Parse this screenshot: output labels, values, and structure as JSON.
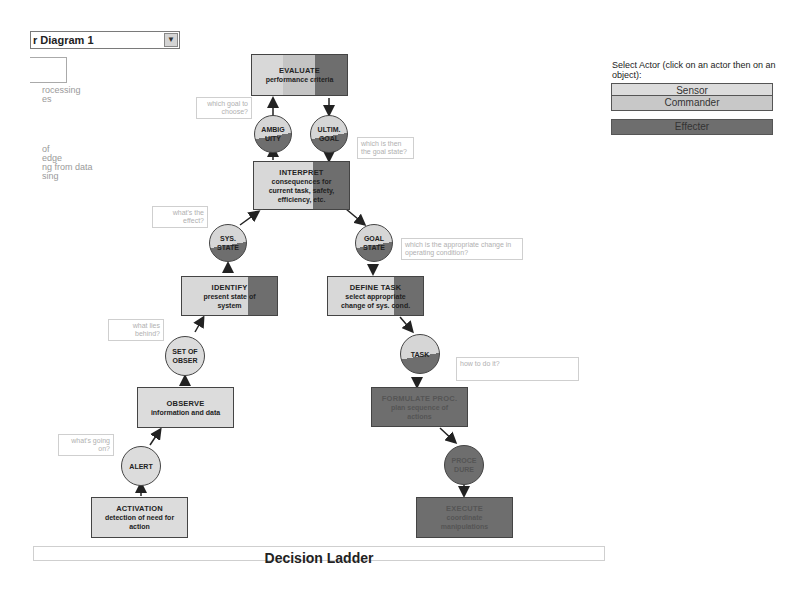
{
  "toolbar": {
    "diagram_select_value": "r Diagram 1",
    "diagram_select_arrow": "▼"
  },
  "left_panel": {
    "text_lines_a": [
      "rocessing",
      "es"
    ],
    "text_lines_b": [
      "of",
      "edge",
      "ng from data",
      "sing"
    ]
  },
  "actor_panel": {
    "title": "Select Actor (click on an actor then on an object):",
    "actors": [
      {
        "label": "Sensor",
        "color": "#d8d8d8"
      },
      {
        "label": "Commander",
        "color": "#c4c4c4"
      },
      {
        "label": "Effecter",
        "color": "#6e6e6e"
      }
    ]
  },
  "diagram": {
    "title": "Decision Ladder",
    "nodes": {
      "evaluate": {
        "title": "EVALUATE",
        "sub": "performance criteria"
      },
      "ambiguity": {
        "line1": "AMBIG",
        "line2": "UITY"
      },
      "ultim_goal": {
        "line1": "ULTIM.",
        "line2": "GOAL"
      },
      "interpret": {
        "title": "INTERPRET",
        "sub1": "consequences for",
        "sub2": "current task, safety,",
        "sub3": "efficiency, etc."
      },
      "sys_state": {
        "line1": "SYS.",
        "line2": "STATE"
      },
      "goal_state": {
        "line1": "GOAL",
        "line2": "STATE"
      },
      "identify": {
        "title": "IDENTIFY",
        "sub1": "present state of",
        "sub2": "system"
      },
      "define_task": {
        "title": "DEFINE TASK",
        "sub1": "select appropriate",
        "sub2": "change of sys. cond."
      },
      "set_of_obser": {
        "line1": "SET OF",
        "line2": "OBSER"
      },
      "task": {
        "line1": "TASK"
      },
      "observe": {
        "title": "OBSERVE",
        "sub1": "information and data"
      },
      "formulate_proc": {
        "title": "FORMULATE PROC.",
        "sub1": "plan sequence of",
        "sub2": "actions"
      },
      "alert": {
        "line1": "ALERT"
      },
      "procedure": {
        "line1": "PROCE",
        "line2": "DURE"
      },
      "activation": {
        "title": "ACTIVATION",
        "sub1": "detection of need for",
        "sub2": "action"
      },
      "execute": {
        "title": "EXECUTE",
        "sub1": "coordinate",
        "sub2": "manipulations"
      }
    },
    "notes": {
      "which_goal": "which goal to choose?",
      "which_goal_state": "which is then the goal state?",
      "whats_effect": "what's the effect?",
      "which_change": "which is the appropriate change in operating condition?",
      "what_lies_behind": "what lies behind?",
      "how_to_do": "how to do it?",
      "whats_going_on": "what's going on?"
    }
  }
}
